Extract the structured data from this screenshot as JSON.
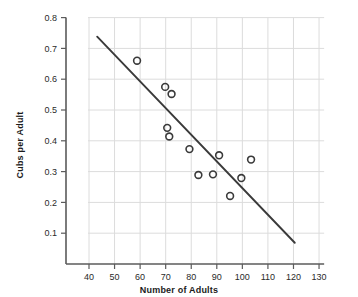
{
  "chart_data": {
    "type": "scatter",
    "title": "",
    "xlabel": "Number of Adults",
    "ylabel": "Cubs per Adult",
    "xlim": [
      33,
      132
    ],
    "ylim": [
      0,
      0.8
    ],
    "grid": true,
    "legend": null,
    "xticks": [
      40,
      50,
      60,
      70,
      80,
      90,
      100,
      110,
      120,
      130
    ],
    "xtick_labels": [
      "40",
      "50",
      "60",
      "70",
      "80",
      "90",
      "100",
      "110",
      "120",
      "130"
    ],
    "yticks": [
      0.1,
      0.2,
      0.3,
      0.4,
      0.5,
      0.6,
      0.7,
      0.8
    ],
    "ytick_labels": [
      "0.1",
      "0.2",
      "0.3",
      "0.4",
      "0.5",
      "0.6",
      "0.7",
      "0.8"
    ],
    "points": [
      {
        "x": 58.8,
        "y": 0.66
      },
      {
        "x": 69.8,
        "y": 0.575
      },
      {
        "x": 72.3,
        "y": 0.552
      },
      {
        "x": 70.6,
        "y": 0.442
      },
      {
        "x": 71.4,
        "y": 0.414
      },
      {
        "x": 79.3,
        "y": 0.373
      },
      {
        "x": 82.8,
        "y": 0.289
      },
      {
        "x": 88.5,
        "y": 0.291
      },
      {
        "x": 90.9,
        "y": 0.353
      },
      {
        "x": 95.2,
        "y": 0.221
      },
      {
        "x": 99.6,
        "y": 0.279
      },
      {
        "x": 103.4,
        "y": 0.339
      }
    ],
    "trendline": {
      "x0": 43.2,
      "y0": 0.738,
      "x1": 120.5,
      "y1": 0.069
    },
    "marker": {
      "shape": "open-circle",
      "size": 5,
      "color": "#3a3a3a"
    },
    "colors": {
      "axis": "#5b5b5b",
      "grid": "#dcdcdc",
      "marker": "#3a3a3a",
      "trendline": "#3a3a3a",
      "text": "#1b1b1b",
      "background": "#ffffff"
    }
  }
}
